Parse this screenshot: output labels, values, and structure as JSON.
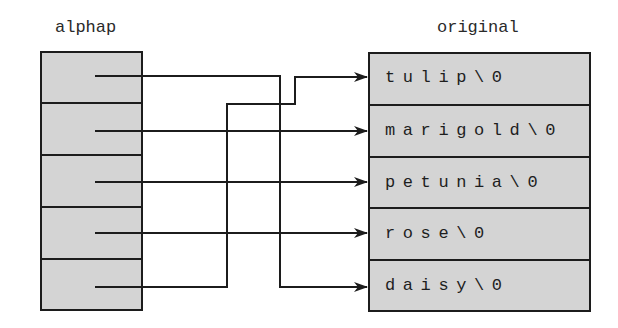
{
  "diagram": {
    "type": "pointer-array-to-strings",
    "pointer_array": {
      "label": "alphap",
      "cells": 5
    },
    "string_array": {
      "label": "original",
      "strings": [
        "tulip\\0",
        "marigold\\0",
        "petunia\\0",
        "rose\\0",
        "daisy\\0"
      ]
    },
    "edges": [
      {
        "from": "alphap[0]",
        "to": "daisy\\0"
      },
      {
        "from": "alphap[1]",
        "to": "marigold\\0"
      },
      {
        "from": "alphap[2]",
        "to": "petunia\\0"
      },
      {
        "from": "alphap[3]",
        "to": "rose\\0"
      },
      {
        "from": "alphap[4]",
        "to": "tulip\\0"
      }
    ],
    "colors": {
      "cell_fill": "#d4d4d4",
      "stroke": "#1c1c1c",
      "background": "#ffffff"
    }
  }
}
